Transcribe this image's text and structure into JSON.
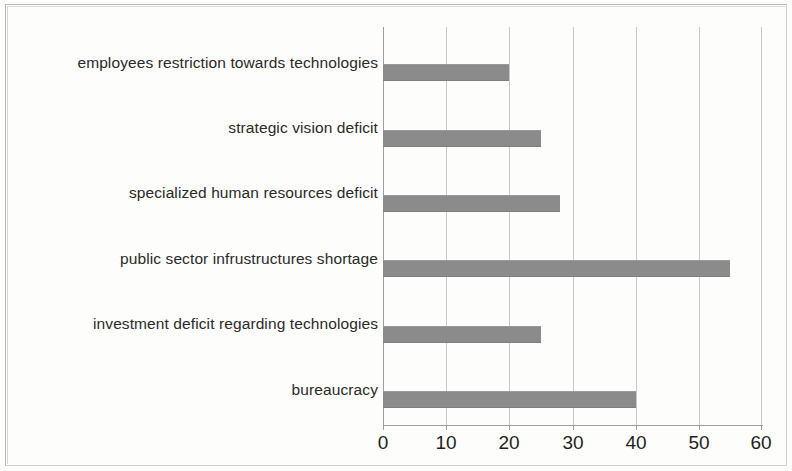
{
  "chart_data": {
    "type": "bar",
    "orientation": "horizontal",
    "title": "",
    "subtitle": "",
    "xlabel": "",
    "ylabel": "",
    "categories": [
      "employees restriction towards technologies",
      "strategic vision deficit",
      "specialized human resources deficit",
      "public sector infrustructures shortage",
      "investment deficit regarding technologies",
      "bureaucracy"
    ],
    "values": [
      20,
      25,
      28,
      55,
      25,
      40
    ],
    "xlim": [
      0,
      60
    ],
    "xticks": [
      0,
      10,
      20,
      30,
      40,
      50,
      60
    ],
    "xtick_labels": [
      "0",
      "10",
      "20",
      "30",
      "40",
      "50",
      "60"
    ],
    "grid": "vertical",
    "legend": "none",
    "bar_color": "#8b8b8b",
    "gridline_color": "#c8c8c8",
    "axis_color": "#a0a0a0",
    "text_color": "#2a2a2a",
    "background_color": "#fdfdfc"
  }
}
